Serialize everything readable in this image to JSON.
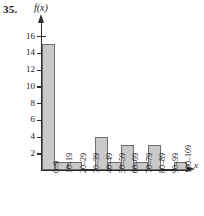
{
  "problem": {
    "number": "35."
  },
  "axes": {
    "y_label": "f(x)",
    "x_label": "x",
    "y_ticks": [
      {
        "value": 2,
        "label": "2"
      },
      {
        "value": 4,
        "label": "4"
      },
      {
        "value": 6,
        "label": "6"
      },
      {
        "value": 8,
        "label": "8"
      },
      {
        "value": 10,
        "label": "10"
      },
      {
        "value": 12,
        "label": "12"
      },
      {
        "value": 14,
        "label": "14"
      },
      {
        "value": 16,
        "label": "16"
      }
    ]
  },
  "colors": {
    "bar_fill": "#c9c9c9",
    "bar_stroke": "#6e6e6e",
    "axis": "#2b2b2b",
    "text": "#1a1a1a",
    "background": "#ffffff"
  },
  "chart_data": {
    "type": "bar",
    "title": "",
    "xlabel": "x",
    "ylabel": "f(x)",
    "ylim": [
      0,
      17
    ],
    "grid": false,
    "legend": null,
    "categories": [
      "0–9",
      "10–19",
      "20–29",
      "30–39",
      "40–49",
      "50–59",
      "60–69",
      "70–79",
      "80–89",
      "90–99",
      "100–109"
    ],
    "values": [
      15,
      1,
      1,
      0,
      4,
      1,
      3,
      1,
      3,
      0,
      1
    ],
    "yticks": [
      2,
      4,
      6,
      8,
      10,
      12,
      14,
      16
    ]
  }
}
